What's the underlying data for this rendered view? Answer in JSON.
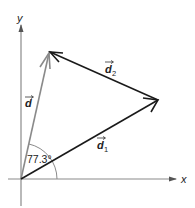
{
  "diagram": {
    "type": "vector-addition",
    "axes": {
      "x_label": "x",
      "y_label": "y"
    },
    "vectors": [
      {
        "name": "d",
        "label": "d",
        "subscript": "",
        "color": "#8a8a8a",
        "from": "origin",
        "to": "tip_d"
      },
      {
        "name": "d1",
        "label": "d",
        "subscript": "1",
        "color": "#1a1a1a",
        "from": "origin",
        "to": "tip_d1"
      },
      {
        "name": "d2",
        "label": "d",
        "subscript": "2",
        "color": "#1a1a1a",
        "from": "tip_d1",
        "to": "tip_d"
      }
    ],
    "angle": {
      "label": "77.3°",
      "between": [
        "x-axis",
        "d"
      ]
    },
    "colors": {
      "axis": "#8a8a8a",
      "resultant": "#8a8a8a",
      "component": "#1a1a1a",
      "arc": "#8a8a8a"
    }
  }
}
